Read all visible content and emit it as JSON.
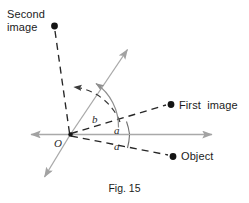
{
  "figure": {
    "caption": "Fig. 15",
    "labels": {
      "second_image": "Second\nimage",
      "first_image": "First  image",
      "object": "Object",
      "origin": "O",
      "angle_b": "b",
      "angle_a_upper": "a",
      "angle_a_lower": "a"
    },
    "colors": {
      "axis_gray": "#a9a9a9",
      "dashed_black": "#262626",
      "arc_gray": "#8f8f8f",
      "point_fill": "#141414",
      "background": "#ffffff",
      "text": "#1b1b1b"
    },
    "points": {
      "origin": {
        "x": 70,
        "y": 135
      },
      "second_image_dot": {
        "x": 54,
        "y": 26
      },
      "first_image_dot": {
        "x": 171,
        "y": 104
      },
      "object_dot": {
        "x": 173,
        "y": 156
      }
    },
    "rays": {
      "mirror_axis_right_end": {
        "x": 216,
        "y": 134
      },
      "mirror_axis_left_end": {
        "x": 27,
        "y": 134
      },
      "second_mirror_up_end": {
        "x": 131,
        "y": 45
      },
      "second_mirror_down_end": {
        "x": 41,
        "y": 181
      }
    }
  }
}
